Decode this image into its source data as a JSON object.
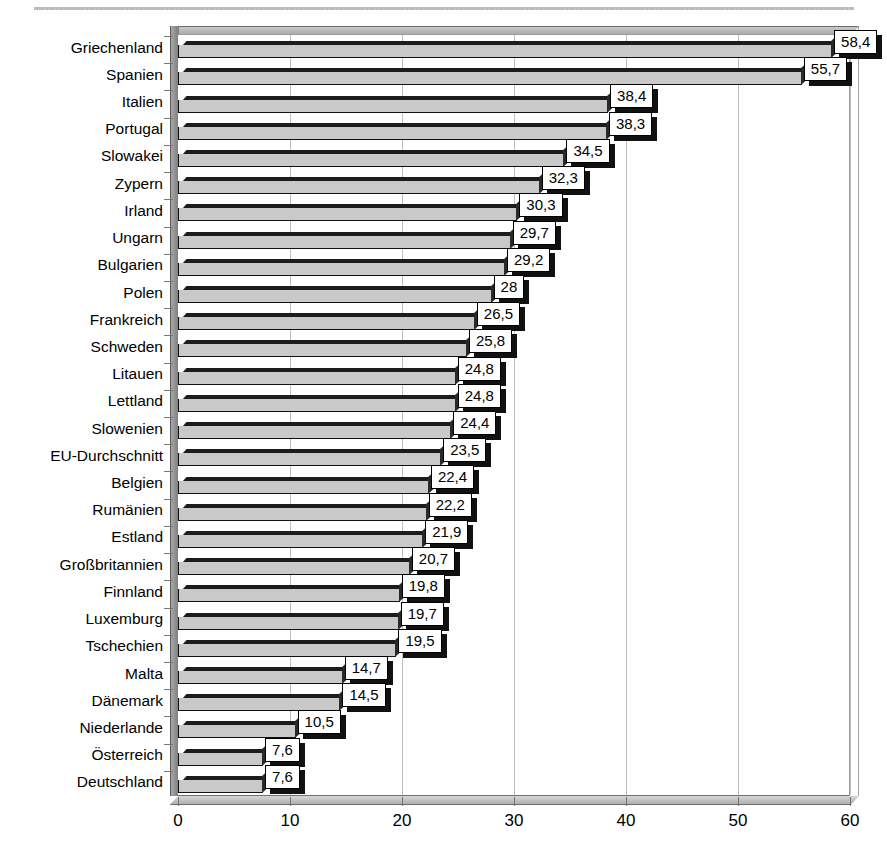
{
  "page": {
    "background_color": "#ffffff",
    "scan_artifact": "top-edge-scan-line"
  },
  "chart_data": {
    "type": "bar",
    "orientation": "horizontal",
    "title": "",
    "subtitle": "",
    "xlabel": "",
    "ylabel": "",
    "xlim": [
      0,
      60
    ],
    "xticks": [
      0,
      10,
      20,
      30,
      40,
      50,
      60
    ],
    "xtick_labels": [
      "0",
      "10",
      "20",
      "30",
      "40",
      "50",
      "60"
    ],
    "grid": true,
    "grid_axis": "x",
    "legend": false,
    "decimal_separator": ",",
    "style": "3d-bar",
    "bar_fill_color": "#c9c9c9",
    "bar_edge_color": "#111111",
    "label_box_color": "#ffffff",
    "label_shadow_color": "#111111",
    "categories": [
      "Griechenland",
      "Spanien",
      "Italien",
      "Portugal",
      "Slowakei",
      "Zypern",
      "Irland",
      "Ungarn",
      "Bulgarien",
      "Polen",
      "Frankreich",
      "Schweden",
      "Litauen",
      "Lettland",
      "Slowenien",
      "EU-Durchschnitt",
      "Belgien",
      "Rumänien",
      "Estland",
      "Großbritannien",
      "Finnland",
      "Luxemburg",
      "Tschechien",
      "Malta",
      "Dänemark",
      "Niederlande",
      "Österreich",
      "Deutschland"
    ],
    "values": [
      58.4,
      55.7,
      38.4,
      38.3,
      34.5,
      32.3,
      30.3,
      29.7,
      29.2,
      28,
      26.5,
      25.8,
      24.8,
      24.8,
      24.4,
      23.5,
      22.4,
      22.2,
      21.9,
      20.7,
      19.8,
      19.7,
      19.5,
      14.7,
      14.5,
      10.5,
      7.6,
      7.6
    ],
    "value_labels": [
      "58,4",
      "55,7",
      "38,4",
      "38,3",
      "34,5",
      "32,3",
      "30,3",
      "29,7",
      "29,2",
      "28",
      "26,5",
      "25,8",
      "24,8",
      "24,8",
      "24,4",
      "23,5",
      "22,4",
      "22,2",
      "21,9",
      "20,7",
      "19,8",
      "19,7",
      "19,5",
      "14,7",
      "14,5",
      "10,5",
      "7,6",
      "7,6"
    ]
  }
}
